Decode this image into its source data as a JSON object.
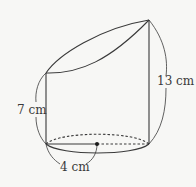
{
  "diagram": {
    "type": "truncated-cylinder",
    "labels": {
      "right_height": "13 cm",
      "left_height": "7 cm",
      "radius": "4 cm"
    },
    "colors": {
      "stroke": "#3a3a3a",
      "background": "#f7f7f5"
    }
  }
}
